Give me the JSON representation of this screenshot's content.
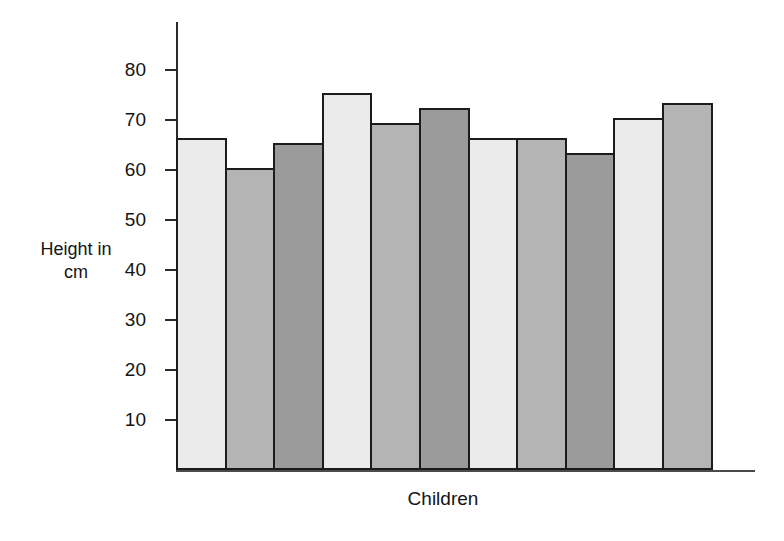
{
  "chart_data": {
    "type": "bar",
    "title": "",
    "xlabel": "Children",
    "ylabel": "Height in cm",
    "ylabel_lines": [
      "Height in",
      "cm"
    ],
    "categories": [
      "1",
      "2",
      "3",
      "4",
      "5",
      "6",
      "7",
      "8",
      "9",
      "10",
      "11"
    ],
    "values": [
      66,
      60,
      65,
      75,
      69,
      72,
      66,
      66,
      63,
      70,
      73
    ],
    "ylim": [
      0,
      85
    ],
    "yticks": [
      10,
      20,
      30,
      40,
      50,
      60,
      70,
      80
    ],
    "ytick_labels": [
      "10",
      "20",
      "30",
      "40",
      "50",
      "60",
      "70",
      "80"
    ],
    "xtick_labels": [],
    "grid": false,
    "legend": false,
    "bar_shades": [
      "light",
      "medium",
      "dark",
      "light",
      "medium",
      "dark",
      "light",
      "medium",
      "dark",
      "light",
      "medium"
    ],
    "colors": {
      "light": "#ebebeb",
      "medium": "#b4b4b4",
      "dark": "#9b9b9b",
      "bar_border": "#1c1c1c",
      "axis": "#2b2b2b",
      "text": "#141414",
      "background": "#ffffff"
    }
  }
}
